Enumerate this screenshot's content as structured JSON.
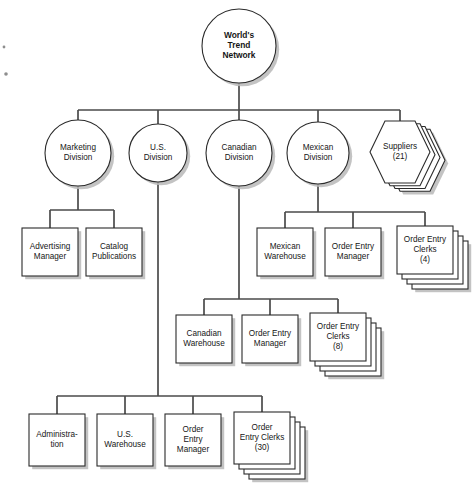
{
  "diagram": {
    "type": "org-chart",
    "colors": {
      "node_fill": "#ffffff",
      "node_stroke": "#2b2b2b",
      "connector": "#4a4a4a",
      "shadow": "#b9b9b9",
      "background": "#ffffff"
    },
    "root": {
      "id": "worlds-trend-network",
      "shape": "circle",
      "lines": [
        "World's",
        "Trend",
        "Network"
      ],
      "bold": true,
      "cx": 239,
      "cy": 46,
      "r": 37
    },
    "divisions": [
      {
        "id": "marketing-division",
        "shape": "circle",
        "lines": [
          "Marketing",
          "Division"
        ],
        "cx": 78,
        "cy": 153,
        "r": 33
      },
      {
        "id": "us-division",
        "shape": "circle",
        "lines": [
          "U.S.",
          "Division"
        ],
        "cx": 158,
        "cy": 153,
        "r": 29
      },
      {
        "id": "canadian-division",
        "shape": "circle",
        "lines": [
          "Canadian",
          "Division"
        ],
        "cx": 239,
        "cy": 153,
        "r": 33
      },
      {
        "id": "mexican-division",
        "shape": "circle",
        "lines": [
          "Mexican",
          "Division"
        ],
        "cx": 318,
        "cy": 153,
        "r": 31
      },
      {
        "id": "suppliers",
        "shape": "hexagon-stack",
        "lines": [
          "Suppliers",
          "(21)"
        ],
        "cx": 400,
        "cy": 152,
        "rx": 30,
        "ry": 31,
        "stack": 3
      }
    ],
    "marketing_children": [
      {
        "id": "advertising-manager",
        "shape": "box",
        "lines": [
          "Advertising",
          "Manager"
        ],
        "x": 22,
        "y": 228,
        "w": 56,
        "h": 48
      },
      {
        "id": "catalog-publications",
        "shape": "box",
        "lines": [
          "Catalog",
          "Publications"
        ],
        "x": 86,
        "y": 228,
        "w": 56,
        "h": 48
      }
    ],
    "mexican_children": [
      {
        "id": "mexican-warehouse",
        "shape": "box",
        "lines": [
          "Mexican",
          "Warehouse"
        ],
        "x": 257,
        "y": 228,
        "w": 56,
        "h": 48
      },
      {
        "id": "mexican-order-entry-manager",
        "shape": "box",
        "lines": [
          "Order Entry",
          "Manager"
        ],
        "x": 325,
        "y": 228,
        "w": 56,
        "h": 48
      },
      {
        "id": "mexican-order-entry-clerks",
        "shape": "box-stack",
        "lines": [
          "Order Entry",
          "Clerks",
          "(4)"
        ],
        "x": 397,
        "y": 226,
        "w": 56,
        "h": 48,
        "stack": 3
      }
    ],
    "canadian_children": [
      {
        "id": "canadian-warehouse",
        "shape": "box",
        "lines": [
          "Canadian",
          "Warehouse"
        ],
        "x": 176,
        "y": 315,
        "w": 56,
        "h": 48
      },
      {
        "id": "canadian-order-entry-manager",
        "shape": "box",
        "lines": [
          "Order Entry",
          "Manager"
        ],
        "x": 242,
        "y": 315,
        "w": 56,
        "h": 48
      },
      {
        "id": "canadian-order-entry-clerks",
        "shape": "box-stack",
        "lines": [
          "Order Entry",
          "Clerks",
          "(8)"
        ],
        "x": 310,
        "y": 313,
        "w": 56,
        "h": 48,
        "stack": 3
      }
    ],
    "us_children": [
      {
        "id": "administration",
        "shape": "box",
        "lines": [
          "Administra-",
          "tion"
        ],
        "x": 29,
        "y": 414,
        "w": 56,
        "h": 52
      },
      {
        "id": "us-warehouse",
        "shape": "box",
        "lines": [
          "U.S.",
          "Warehouse"
        ],
        "x": 97,
        "y": 414,
        "w": 56,
        "h": 52
      },
      {
        "id": "us-order-entry-manager",
        "shape": "box",
        "lines": [
          "Order",
          "Entry",
          "Manager"
        ],
        "x": 165,
        "y": 414,
        "w": 56,
        "h": 52
      },
      {
        "id": "us-order-entry-clerks",
        "shape": "box-stack",
        "lines": [
          "Order",
          "Entry Clerks",
          "(30)"
        ],
        "x": 234,
        "y": 412,
        "w": 56,
        "h": 52,
        "stack": 3
      }
    ],
    "connectors": {
      "root_stem": {
        "x": 239,
        "y1": 83,
        "y2": 110
      },
      "level1_bus": {
        "x1": 78,
        "x2": 400,
        "y": 110
      },
      "level1_drops": [
        {
          "x": 78,
          "y1": 110,
          "y2": 120
        },
        {
          "x": 158,
          "y1": 110,
          "y2": 124
        },
        {
          "x": 239,
          "y1": 110,
          "y2": 120
        },
        {
          "x": 318,
          "y1": 110,
          "y2": 122
        },
        {
          "x": 400,
          "y1": 110,
          "y2": 123
        }
      ],
      "marketing_stem": {
        "x": 78,
        "y1": 186,
        "y2": 210
      },
      "marketing_bus": {
        "x1": 50,
        "x2": 114,
        "y": 210
      },
      "marketing_drops": [
        {
          "x": 50,
          "y1": 210,
          "y2": 228
        },
        {
          "x": 114,
          "y1": 210,
          "y2": 228
        }
      ],
      "mexican_stem": {
        "x": 318,
        "y1": 184,
        "y2": 212
      },
      "mexican_bus": {
        "x1": 285,
        "x2": 425,
        "y": 212
      },
      "mexican_drops": [
        {
          "x": 285,
          "y1": 212,
          "y2": 228
        },
        {
          "x": 353,
          "y1": 212,
          "y2": 228
        },
        {
          "x": 425,
          "y1": 212,
          "y2": 226
        }
      ],
      "canadian_stem": {
        "x": 239,
        "y1": 186,
        "y2": 299
      },
      "canadian_bus": {
        "x1": 204,
        "x2": 338,
        "y": 299
      },
      "canadian_drops": [
        {
          "x": 204,
          "y1": 299,
          "y2": 315
        },
        {
          "x": 270,
          "y1": 299,
          "y2": 315
        },
        {
          "x": 338,
          "y1": 299,
          "y2": 313
        }
      ],
      "us_stem": {
        "x": 158,
        "y1": 182,
        "y2": 396
      },
      "us_bus": {
        "x1": 57,
        "x2": 262,
        "y": 396
      },
      "us_drops": [
        {
          "x": 57,
          "y1": 396,
          "y2": 414
        },
        {
          "x": 125,
          "y1": 396,
          "y2": 414
        },
        {
          "x": 193,
          "y1": 396,
          "y2": 414
        },
        {
          "x": 262,
          "y1": 396,
          "y2": 412
        }
      ]
    },
    "specks": [
      {
        "cx": 4,
        "cy": 47,
        "r": 1.4
      },
      {
        "cx": 6,
        "cy": 74,
        "r": 1.8
      }
    ]
  }
}
